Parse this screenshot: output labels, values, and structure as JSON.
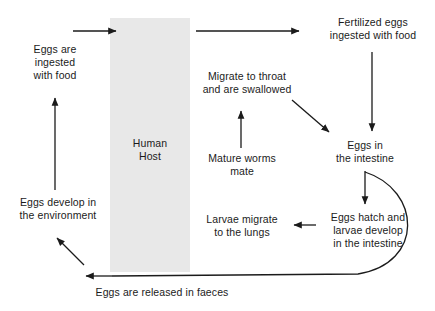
{
  "diagram": {
    "background_color": "#ffffff",
    "line_color": "#1b1b1b",
    "text_color": "#1b1b1b",
    "host_band": {
      "label": "Human\nHost",
      "fill_color": "#e8e8e8",
      "x": 110,
      "y": 18,
      "width": 80,
      "height": 254
    },
    "nodes": [
      {
        "id": "eggs-ingested-with-food",
        "label": "Eggs are\ningested\nwith food",
        "x": 12,
        "y": 43,
        "width": 86,
        "align": "center"
      },
      {
        "id": "migrate-to-throat",
        "label": "Migrate to throat\nand are swallowed",
        "x": 192,
        "y": 70,
        "width": 110,
        "align": "center"
      },
      {
        "id": "fertilized-eggs-ingested",
        "label": "Fertilized eggs\ningested with food",
        "x": 318,
        "y": 16,
        "width": 110,
        "align": "center"
      },
      {
        "id": "mature-worms-mate",
        "label": "Mature worms\nmate",
        "x": 196,
        "y": 152,
        "width": 92,
        "align": "center"
      },
      {
        "id": "eggs-in-the-intestine",
        "label": "Eggs in\nthe intestine",
        "x": 324,
        "y": 139,
        "width": 82,
        "align": "center"
      },
      {
        "id": "eggs-develop-in-environment",
        "label": "Eggs develop in\nthe environment",
        "x": 8,
        "y": 196,
        "width": 100,
        "align": "center"
      },
      {
        "id": "larvae-migrate-to-lungs",
        "label": "Larvae migrate\nto the lungs",
        "x": 196,
        "y": 213,
        "width": 92,
        "align": "center"
      },
      {
        "id": "eggs-hatch-larvae-develop",
        "label": "Eggs hatch and\nlarvae develop\nin the intestine",
        "x": 322,
        "y": 211,
        "width": 92,
        "align": "center"
      },
      {
        "id": "eggs-released-in-faeces",
        "label": "Eggs are released in faeces",
        "x": 78,
        "y": 286,
        "width": 168,
        "align": "center"
      }
    ],
    "arrows": [
      {
        "id": "arrow-into-host-top",
        "from": "eggs-ingested-with-food",
        "to": "human-host",
        "kind": "straight",
        "x1": 73,
        "y1": 31,
        "x2": 118,
        "y2": 31
      },
      {
        "id": "arrow-host-to-fertilized-eggs",
        "from": "human-host",
        "to": "fertilized-eggs-ingested",
        "kind": "straight",
        "x1": 196,
        "y1": 31,
        "x2": 301,
        "y2": 31
      },
      {
        "id": "arrow-fertilized-eggs-to-eggs-in-intestine",
        "from": "fertilized-eggs-ingested",
        "to": "eggs-in-the-intestine",
        "kind": "straight",
        "x1": 372,
        "y1": 52,
        "x2": 372,
        "y2": 133
      },
      {
        "id": "arrow-migrate-throat-to-eggs-in-intestine",
        "from": "migrate-to-throat",
        "to": "eggs-in-the-intestine",
        "kind": "diagonal",
        "x1": 292,
        "y1": 100,
        "x2": 331,
        "y2": 134
      },
      {
        "id": "arrow-mature-worms-to-migrate-throat",
        "from": "mature-worms-mate",
        "to": "migrate-to-throat",
        "kind": "straight",
        "x1": 241,
        "y1": 148,
        "x2": 241,
        "y2": 109
      },
      {
        "id": "arrow-eggs-in-intestine-to-eggs-hatch",
        "from": "eggs-in-the-intestine",
        "to": "eggs-hatch-larvae-develop",
        "kind": "straight",
        "x1": 365,
        "y1": 171,
        "x2": 365,
        "y2": 206
      },
      {
        "id": "arrow-eggs-hatch-to-larvae-migrate",
        "from": "eggs-hatch-larvae-develop",
        "to": "larvae-migrate-to-lungs",
        "kind": "straight",
        "x1": 316,
        "y1": 225,
        "x2": 292,
        "y2": 225
      },
      {
        "id": "arrow-eggs-hatch-to-faeces-curve",
        "from": "eggs-hatch-larvae-develop",
        "to": "eggs-released-in-faeces",
        "kind": "curved",
        "path": "M 365,172 C 420,188 424,262 360,274 L 110,276"
      },
      {
        "id": "arrow-faeces-to-eggs-develop",
        "from": "eggs-released-in-faeces",
        "to": "eggs-develop-in-environment",
        "kind": "diagonal",
        "x1": 84,
        "y1": 264,
        "x2": 55,
        "y2": 236
      },
      {
        "id": "arrow-eggs-develop-to-eggs-ingested",
        "from": "eggs-develop-in-environment",
        "to": "eggs-ingested-with-food",
        "kind": "straight",
        "x1": 55,
        "y1": 190,
        "x2": 55,
        "y2": 100
      }
    ]
  }
}
